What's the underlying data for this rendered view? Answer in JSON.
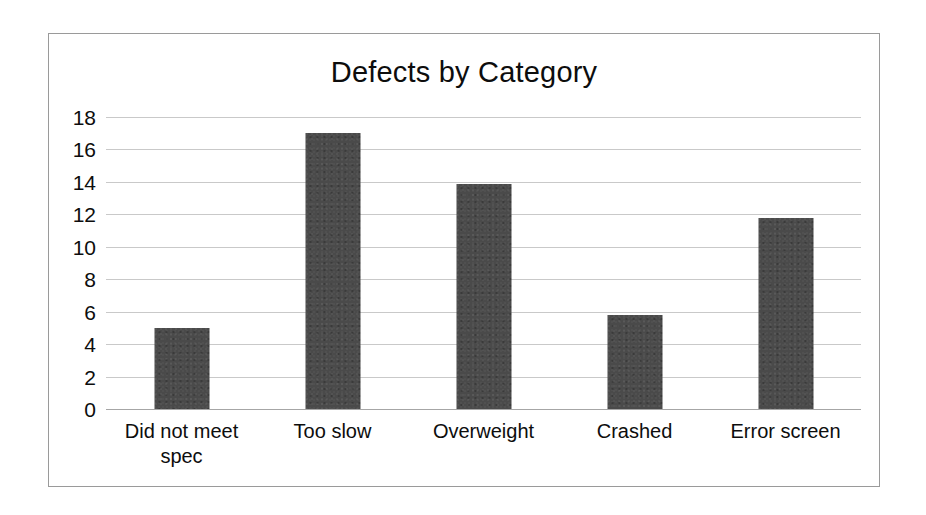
{
  "chart_data": {
    "type": "bar",
    "title": "Defects by Category",
    "xlabel": "",
    "ylabel": "",
    "categories": [
      "Did not meet spec",
      "Too slow",
      "Overweight",
      "Crashed",
      "Error screen"
    ],
    "values": [
      5,
      17,
      13.9,
      5.8,
      11.8
    ],
    "ylim": [
      0,
      18
    ],
    "ytick_labels": [
      "18",
      "16",
      "14",
      "12",
      "10",
      "8",
      "6",
      "4",
      "2",
      "0"
    ],
    "ytick_values": [
      18,
      16,
      14,
      12,
      10,
      8,
      6,
      4,
      2,
      0
    ],
    "ytick_step": 2,
    "grid": true,
    "legend": false,
    "bar_color": "#4a4a4a",
    "grid_color": "#c9c9c9",
    "axis_color": "#a6a6a6",
    "frame_color": "#9a9a9a",
    "text_color": "#0d0d0d"
  }
}
